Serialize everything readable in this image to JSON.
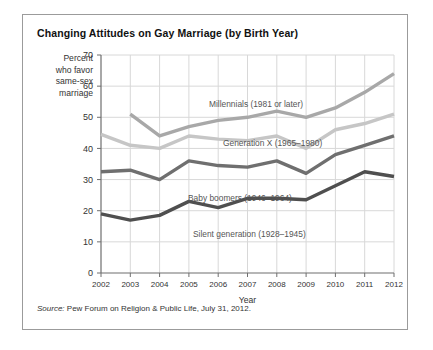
{
  "title": "Changing Attitudes on Gay Marriage (by Birth Year)",
  "axis_title_lines": [
    "Percent",
    "who favor",
    "same-sex",
    "marriage"
  ],
  "source": {
    "prefix": "Source:",
    "text": " Pew Forum on Religion & Public Life, July 31, 2012."
  },
  "colors": {
    "millennials": "#a8a8a8",
    "genx": "#c6c6c6",
    "boomers": "#6f6f6f",
    "silent": "#4f4f4f",
    "grid": "#d8d8d8",
    "axis": "#6e6e6e",
    "border": "#9b9b9b",
    "text": "#333333"
  },
  "chart_data": {
    "type": "line",
    "title": "Changing Attitudes on Gay Marriage (by Birth Year)",
    "xlabel": "Year",
    "ylabel": "Percent who favor same-sex marriage",
    "x": [
      2002,
      2003,
      2004,
      2005,
      2006,
      2007,
      2008,
      2009,
      2010,
      2011,
      2012
    ],
    "xticklabels": [
      "2002",
      "2003",
      "2004",
      "2005",
      "2006",
      "2007",
      "2008",
      "2009",
      "2010",
      "2011",
      "2012"
    ],
    "ylim": [
      0,
      70
    ],
    "yticks": [
      0,
      10,
      20,
      30,
      40,
      50,
      60,
      70
    ],
    "grid": true,
    "legend": "inline-labels",
    "series": [
      {
        "name": "Millennials (1981 or later)",
        "label": "Millennials (1981 or later)",
        "color": "#a8a8a8",
        "x": [
          2003,
          2004,
          2005,
          2006,
          2007,
          2008,
          2009,
          2010,
          2011,
          2012
        ],
        "values": [
          51,
          44,
          47,
          49,
          50,
          52,
          50,
          53,
          58,
          64
        ]
      },
      {
        "name": "Generation X (1965-1980)",
        "label": "Generation X (1965–1980)",
        "color": "#c6c6c6",
        "x": [
          2002,
          2003,
          2004,
          2005,
          2006,
          2007,
          2008,
          2009,
          2010,
          2011,
          2012
        ],
        "values": [
          44.5,
          41,
          40,
          44,
          43,
          42.5,
          44,
          40,
          46,
          48,
          51
        ]
      },
      {
        "name": "Baby boomers (1946-1964)",
        "label": "Baby boomers (1946–1964)",
        "color": "#6f6f6f",
        "x": [
          2002,
          2003,
          2004,
          2005,
          2006,
          2007,
          2008,
          2009,
          2010,
          2011,
          2012
        ],
        "values": [
          32.5,
          33,
          30,
          36,
          34.5,
          34,
          36,
          32,
          38,
          41,
          44
        ]
      },
      {
        "name": "Silent generation (1928-1945)",
        "label": "Silent generation (1928–1945)",
        "color": "#4f4f4f",
        "x": [
          2002,
          2003,
          2004,
          2005,
          2006,
          2007,
          2008,
          2009,
          2010,
          2011,
          2012
        ],
        "values": [
          19,
          17,
          18.5,
          23,
          21,
          24,
          24,
          23.5,
          28,
          32.5,
          31
        ]
      }
    ]
  }
}
